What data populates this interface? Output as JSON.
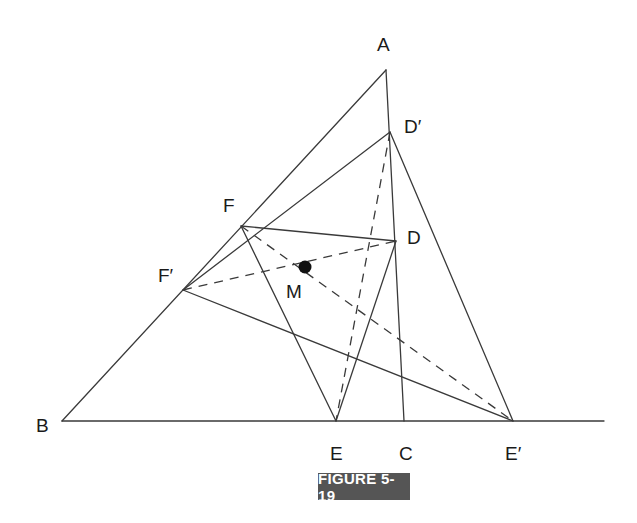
{
  "figure": {
    "caption": "FIGURE 5-19",
    "points": {
      "A": {
        "label": "A",
        "x": 386,
        "y": 70
      },
      "B": {
        "label": "B",
        "x": 62,
        "y": 421
      },
      "C": {
        "label": "C",
        "x": 404,
        "y": 421
      },
      "D": {
        "label": "D",
        "x": 396,
        "y": 241
      },
      "Dp": {
        "label": "D′",
        "x": 390,
        "y": 132
      },
      "E": {
        "label": "E",
        "x": 336,
        "y": 421
      },
      "Ep": {
        "label": "E′",
        "x": 513,
        "y": 421
      },
      "F": {
        "label": "F",
        "x": 241,
        "y": 226
      },
      "Fp": {
        "label": "F′",
        "x": 183,
        "y": 290
      },
      "M": {
        "label": "M",
        "x": 305,
        "y": 267
      }
    },
    "solid_segments": [
      "A-B",
      "B-baseline-end",
      "A-C",
      "D-E",
      "E-F",
      "F-D",
      "Dp-Ep",
      "Ep-Fp",
      "Fp-Dp"
    ],
    "dashed_segments": [
      "Dp-E",
      "F-Ep",
      "Fp-D"
    ],
    "marked_point": "M"
  }
}
